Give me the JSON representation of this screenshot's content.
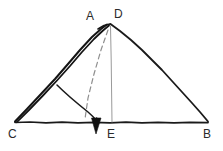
{
  "figure": {
    "kind": "hand-drawn-geometry-diagram",
    "background_color": "#ffffff",
    "ink_color": "#1a1a1a",
    "construction_color": "#8a8a8a",
    "width": 223,
    "height": 151,
    "labels": {
      "apex_left": "A",
      "apex_right": "D",
      "base_left": "C",
      "base_right": "B",
      "base_foot": "E"
    },
    "segments": {
      "side_ca": "CA",
      "side_db": "DB",
      "base_cb": "CB",
      "altitude_de": "DE",
      "bisector_dashed": "D-to-base",
      "arc_sweep": "arc",
      "arrow": "downward-arrow"
    },
    "points": {
      "apex": {
        "x": 110,
        "y": 24
      },
      "c": {
        "x": 15,
        "y": 122
      },
      "b": {
        "x": 208,
        "y": 122
      },
      "e": {
        "x": 112,
        "y": 122
      },
      "dashed_foot": {
        "x": 85,
        "y": 120
      },
      "arc_start": {
        "x": 57,
        "y": 85
      },
      "arc_end": {
        "x": 97,
        "y": 120
      },
      "arrow_tip": {
        "x": 96,
        "y": 133
      }
    }
  }
}
